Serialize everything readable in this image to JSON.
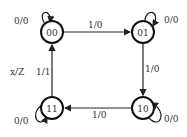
{
  "diagram": {
    "type": "state-machine",
    "legend": "x/Z",
    "states": [
      {
        "id": "00",
        "label": "00",
        "self_loop": "0/0"
      },
      {
        "id": "01",
        "label": "01",
        "self_loop": "0/0"
      },
      {
        "id": "10",
        "label": "10",
        "self_loop": "0/0"
      },
      {
        "id": "11",
        "label": "11",
        "self_loop": "0/0"
      }
    ],
    "transitions": [
      {
        "from": "00",
        "to": "01",
        "label": "1/0"
      },
      {
        "from": "01",
        "to": "10",
        "label": "1/0"
      },
      {
        "from": "10",
        "to": "11",
        "label": "1/0"
      },
      {
        "from": "11",
        "to": "00",
        "label": "1/1"
      }
    ]
  }
}
